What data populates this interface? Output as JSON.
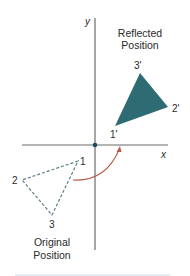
{
  "figure": {
    "type": "reflection-diagram",
    "axes": {
      "x_label": "x",
      "y_label": "y",
      "origin": [
        95,
        145
      ],
      "x_range_px": [
        22,
        168
      ],
      "y_range_px": [
        18,
        250
      ],
      "color": "#6b6b6b",
      "origin_dot_color": "#1f4a66"
    },
    "reflected": {
      "title_line1": "Reflected",
      "title_line2": "Position",
      "fill_color": "#2f6b72",
      "vertices": [
        {
          "label": "1'",
          "point": [
            115,
            126
          ]
        },
        {
          "label": "2'",
          "point": [
            168,
            107
          ]
        },
        {
          "label": "3'",
          "point": [
            140,
            73
          ]
        }
      ]
    },
    "original": {
      "title_line1": "Original",
      "title_line2": "Position",
      "stroke_color": "#5f7f86",
      "style": "dashed",
      "vertices": [
        {
          "label": "1",
          "point": [
            78,
            161
          ]
        },
        {
          "label": "2",
          "point": [
            22,
            180
          ]
        },
        {
          "label": "3",
          "point": [
            52,
            215
          ]
        }
      ]
    },
    "arc": {
      "color": "#b85a45",
      "from": [
        73,
        180
      ],
      "to": [
        120,
        148
      ]
    },
    "footer_rule_color": "#dbe9f2"
  }
}
